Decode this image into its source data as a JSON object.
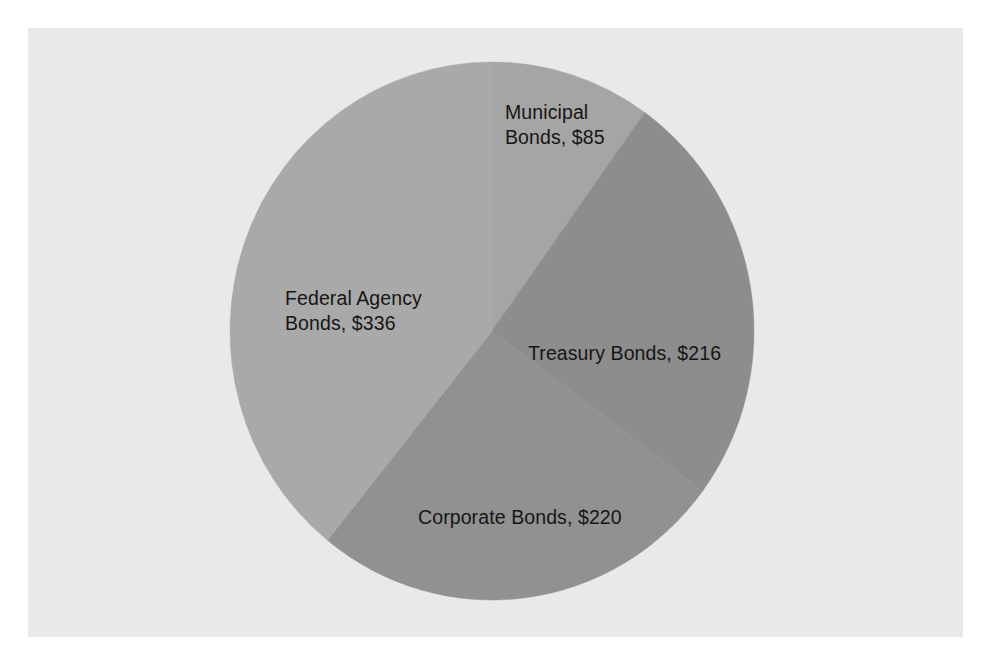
{
  "figure": {
    "background_color": "#ffffff",
    "plot_background_color": "#e9e9e8",
    "label_text_color": "#161616"
  },
  "chart_data": {
    "type": "pie",
    "title": "",
    "subtitle": "",
    "xlabel": "",
    "ylabel": "",
    "legend_position": "none",
    "grid": false,
    "value_prefix": "$",
    "total": 857,
    "start_angle_deg": 0,
    "direction": "clockwise",
    "categories": [
      "Municipal Bonds",
      "Treasury Bonds",
      "Corporate Bonds",
      "Federal Agency Bonds"
    ],
    "values": [
      85,
      216,
      220,
      336
    ],
    "labels": [
      "Municipal\nBonds, $85",
      "Treasury Bonds, $216",
      "Corporate Bonds, $220",
      "Federal Agency\nBonds, $336"
    ],
    "slices": [
      {
        "name": "Municipal Bonds",
        "value": 85,
        "value_label": "$85",
        "label": "Municipal\nBonds, $85",
        "percent": "9.9%",
        "color": "#a5a5a5",
        "start_angle_deg": 0.0,
        "end_angle_deg": 35.7
      },
      {
        "name": "Treasury Bonds",
        "value": 216,
        "value_label": "$216",
        "label": "Treasury Bonds, $216",
        "percent": "25.2%",
        "color": "#8d8d8d",
        "start_angle_deg": 35.7,
        "end_angle_deg": 126.5
      },
      {
        "name": "Corporate Bonds",
        "value": 220,
        "value_label": "$220",
        "label": "Corporate Bonds, $220",
        "percent": "25.7%",
        "color": "#919191",
        "start_angle_deg": 126.5,
        "end_angle_deg": 218.9
      },
      {
        "name": "Federal Agency Bonds",
        "value": 336,
        "value_label": "$336",
        "label": "Federal Agency\nBonds, $336",
        "percent": "39.2%",
        "color": "#a9a9a9",
        "start_angle_deg": 218.9,
        "end_angle_deg": 360.0
      }
    ]
  }
}
